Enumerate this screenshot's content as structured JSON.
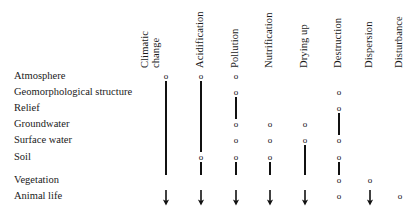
{
  "diagram": {
    "type": "matrix",
    "column_headers": [
      {
        "id": "climatic-change",
        "lines": [
          "Climatic",
          "change"
        ],
        "label": "Climatic change",
        "x": 166
      },
      {
        "id": "acidification",
        "lines": [
          "Acidification"
        ],
        "label": "Acidification",
        "x": 201
      },
      {
        "id": "pollution",
        "lines": [
          "Pollution"
        ],
        "label": "Pollution",
        "x": 236
      },
      {
        "id": "nutrification",
        "lines": [
          "Nutrification"
        ],
        "label": "Nutrification",
        "x": 270
      },
      {
        "id": "drying-up",
        "lines": [
          "Drying up"
        ],
        "label": "Drying up",
        "x": 305
      },
      {
        "id": "destruction",
        "lines": [
          "Destruction"
        ],
        "label": "Destruction",
        "x": 339
      },
      {
        "id": "dispersion",
        "lines": [
          "Dispersion"
        ],
        "label": "Dispersion",
        "x": 370
      },
      {
        "id": "disturbance",
        "lines": [
          "Disturbance"
        ],
        "label": "Disturbance",
        "x": 400
      }
    ],
    "row_labels": [
      {
        "id": "atmosphere",
        "label": "Atmosphere",
        "y": 76
      },
      {
        "id": "geomorphological-structure",
        "label": "Geomorphological structure",
        "y": 92
      },
      {
        "id": "relief",
        "label": "Relief",
        "y": 108
      },
      {
        "id": "groundwater",
        "label": "Groundwater",
        "y": 124
      },
      {
        "id": "surface-water",
        "label": "Surface water",
        "y": 140
      },
      {
        "id": "soil",
        "label": "Soil",
        "y": 157
      },
      {
        "id": "vegetation",
        "label": "Vegetation",
        "y": 180
      },
      {
        "id": "animal-life",
        "label": "Animal life",
        "y": 196
      }
    ],
    "marker_glyphs": {
      "node": "o",
      "connector": "vertical-bar",
      "terminator": "down-arrow"
    },
    "marker_color": "#111111",
    "nodes": [
      {
        "row": "atmosphere",
        "col": "climatic-change",
        "glyph": "o"
      },
      {
        "row": "atmosphere",
        "col": "acidification",
        "glyph": "o"
      },
      {
        "row": "atmosphere",
        "col": "pollution",
        "glyph": "o"
      },
      {
        "row": "geomorphological-structure",
        "col": "pollution",
        "glyph": "o"
      },
      {
        "row": "geomorphological-structure",
        "col": "destruction",
        "glyph": "o"
      },
      {
        "row": "relief",
        "col": "destruction",
        "glyph": "o"
      },
      {
        "row": "groundwater",
        "col": "pollution",
        "glyph": "o"
      },
      {
        "row": "groundwater",
        "col": "nutrification",
        "glyph": "o"
      },
      {
        "row": "groundwater",
        "col": "drying-up",
        "glyph": "o"
      },
      {
        "row": "surface-water",
        "col": "pollution",
        "glyph": "o"
      },
      {
        "row": "surface-water",
        "col": "nutrification",
        "glyph": "o"
      },
      {
        "row": "surface-water",
        "col": "drying-up",
        "glyph": "o"
      },
      {
        "row": "surface-water",
        "col": "destruction",
        "glyph": "o"
      },
      {
        "row": "soil",
        "col": "acidification",
        "glyph": "o"
      },
      {
        "row": "soil",
        "col": "pollution",
        "glyph": "o"
      },
      {
        "row": "soil",
        "col": "nutrification",
        "glyph": "o"
      },
      {
        "row": "soil",
        "col": "destruction",
        "glyph": "o"
      },
      {
        "row": "vegetation",
        "col": "destruction",
        "glyph": "o"
      },
      {
        "row": "vegetation",
        "col": "dispersion",
        "glyph": "o"
      },
      {
        "row": "animal-life",
        "col": "destruction",
        "glyph": "o"
      },
      {
        "row": "animal-life",
        "col": "disturbance",
        "glyph": "o"
      }
    ],
    "connectors": [
      {
        "col": "climatic-change",
        "from_row": "atmosphere",
        "to_row": "vegetation"
      },
      {
        "col": "acidification",
        "from_row": "atmosphere",
        "to_row": "soil"
      },
      {
        "col": "acidification",
        "from_row": "soil",
        "to_row": "vegetation"
      },
      {
        "col": "pollution",
        "from_row": "geomorphological-structure",
        "to_row": "groundwater"
      },
      {
        "col": "pollution",
        "from_row": "soil",
        "to_row": "vegetation"
      },
      {
        "col": "nutrification",
        "from_row": "soil",
        "to_row": "vegetation"
      },
      {
        "col": "drying-up",
        "from_row": "surface-water",
        "to_row": "vegetation"
      },
      {
        "col": "destruction",
        "from_row": "relief",
        "to_row": "surface-water"
      },
      {
        "col": "destruction",
        "from_row": "soil",
        "to_row": "vegetation"
      }
    ],
    "terminators": [
      {
        "col": "climatic-change",
        "row": "animal-life",
        "glyph": "down-arrow"
      },
      {
        "col": "acidification",
        "row": "animal-life",
        "glyph": "down-arrow"
      },
      {
        "col": "pollution",
        "row": "animal-life",
        "glyph": "down-arrow"
      },
      {
        "col": "nutrification",
        "row": "animal-life",
        "glyph": "down-arrow"
      },
      {
        "col": "drying-up",
        "row": "animal-life",
        "glyph": "down-arrow"
      },
      {
        "col": "dispersion",
        "row": "animal-life",
        "glyph": "down-arrow"
      }
    ]
  }
}
